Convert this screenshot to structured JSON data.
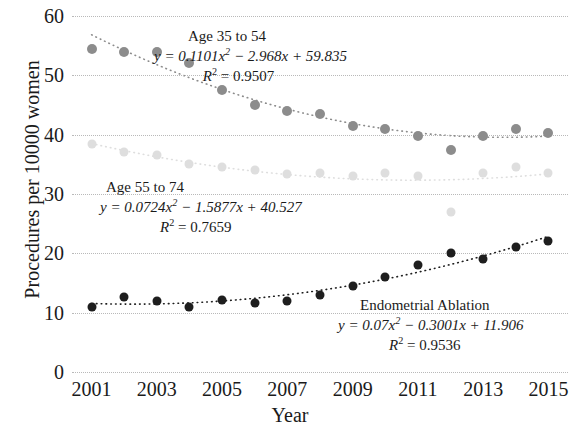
{
  "chart_data": {
    "type": "scatter",
    "title": "",
    "xlabel": "Year",
    "ylabel": "Procedures per 10000 women",
    "xlim": [
      2000.4,
      2015.6
    ],
    "ylim": [
      0,
      60
    ],
    "ytick_values": [
      0,
      10,
      20,
      30,
      40,
      50,
      60
    ],
    "ytick_labels": [
      "0",
      "10",
      "20",
      "30",
      "40",
      "50",
      "60"
    ],
    "xtick_values": [
      2001,
      2003,
      2005,
      2007,
      2009,
      2011,
      2013,
      2015
    ],
    "xtick_labels": [
      "2001",
      "2003",
      "2005",
      "2007",
      "2009",
      "2011",
      "2013",
      "2015"
    ],
    "grid": "horizontal-dotted",
    "legend": "inline-annotations",
    "x": [
      2001,
      2002,
      2003,
      2004,
      2005,
      2006,
      2007,
      2008,
      2009,
      2010,
      2011,
      2012,
      2013,
      2014,
      2015
    ],
    "series": [
      {
        "name": "Age 35 to 54",
        "color": "#8c8c8c",
        "values": [
          54.5,
          54.0,
          54.0,
          52.0,
          47.5,
          45.0,
          44.0,
          43.5,
          41.5,
          41.0,
          39.7,
          37.5,
          39.7,
          41.0,
          40.2
        ],
        "trend_equation": "y = 0.1101x² − 2.968x + 59.835",
        "trend_r2": "R² = 0.9507"
      },
      {
        "name": "Age 55 to 74",
        "color": "#dedede",
        "values": [
          38.5,
          37.0,
          36.5,
          35.0,
          34.5,
          34.0,
          33.3,
          33.6,
          33.0,
          33.5,
          33.0,
          27.0,
          33.6,
          34.5,
          33.5
        ],
        "trend_equation": "y = 0.0724x² − 1.5877x + 40.527",
        "trend_r2": "R² = 0.7659"
      },
      {
        "name": "Endometrial Ablation",
        "color": "#1e1e1e",
        "values": [
          11.0,
          12.7,
          12.0,
          11.0,
          12.2,
          11.7,
          12.0,
          13.0,
          14.5,
          16.0,
          18.0,
          20.0,
          19.0,
          21.0,
          22.0
        ],
        "trend_equation": "y = 0.07x² − 0.3001x + 11.906",
        "trend_r2": "R² = 0.9536"
      }
    ],
    "annotations": [
      {
        "label": "Age 35 to 54",
        "equation_prefix": "y = 0.1101x",
        "equation_exp": "2",
        "equation_rest": " − 2.968x + 59.835",
        "r2_prefix": "R",
        "r2_exp": "2",
        "r2_rest": " = 0.9507"
      },
      {
        "label": "Age 55 to 74",
        "equation_prefix": "y = 0.0724x",
        "equation_exp": "2",
        "equation_rest": " − 1.5877x + 40.527",
        "r2_prefix": "R",
        "r2_exp": "2",
        "r2_rest": " = 0.7659"
      },
      {
        "label": "Endometrial Ablation",
        "equation_prefix": "y = 0.07x",
        "equation_exp": "2",
        "equation_rest": " − 0.3001x + 11.906",
        "r2_prefix": "R",
        "r2_exp": "2",
        "r2_rest": " = 0.9536"
      }
    ]
  }
}
